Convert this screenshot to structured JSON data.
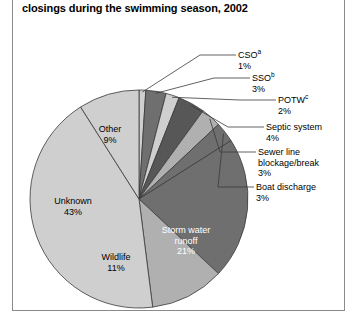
{
  "title": "closings during the swimming season, 2002",
  "colors": {
    "slice_light": "#cfcfcf",
    "slice_mid": "#b0b0b0",
    "slice_dark": "#6f6f6f",
    "slice_darker": "#575757",
    "outline": "#3a3a3a",
    "leader": "#3a3a3a",
    "border": "#8a8a8a",
    "text": "#000000",
    "text_light": "#ffffff"
  },
  "chart_data": {
    "type": "pie",
    "title": "closings during the swimming season, 2002",
    "xlabel": "",
    "ylabel": "",
    "legend_position": "none",
    "grid": false,
    "categories": [
      "CSO",
      "SSO",
      "POTW",
      "Septic system",
      "Sewer line blockage/break",
      "Boat discharge",
      "Storm water runoff",
      "Wildlife",
      "Unknown",
      "Other"
    ],
    "values": [
      1,
      3,
      2,
      4,
      3,
      3,
      21,
      11,
      43,
      9
    ],
    "value_labels": [
      "1%",
      "3%",
      "2%",
      "4%",
      "3%",
      "3%",
      "21%",
      "11%",
      "43%",
      "9%"
    ],
    "footnote_markers": [
      "a",
      "b",
      "c",
      "",
      "",
      "",
      "",
      "",
      "",
      ""
    ],
    "total": 100
  },
  "callouts": [
    {
      "name": "cso",
      "label": "CSO",
      "sup": "a",
      "value": "1%"
    },
    {
      "name": "sso",
      "label": "SSO",
      "sup": "b",
      "value": "3%"
    },
    {
      "name": "potw",
      "label": "POTW",
      "sup": "c",
      "value": "2%"
    },
    {
      "name": "septic",
      "label": "Septic system",
      "sup": "",
      "value": "4%"
    },
    {
      "name": "sewer",
      "label": "Sewer line",
      "label2": "blockage/break",
      "sup": "",
      "value": "3%"
    },
    {
      "name": "boat",
      "label": "Boat discharge",
      "sup": "",
      "value": "3%"
    }
  ],
  "inside_labels": [
    {
      "name": "other",
      "line1": "Other",
      "line2": "",
      "value": "9%"
    },
    {
      "name": "unknown",
      "line1": "Unknown",
      "line2": "",
      "value": "43%"
    },
    {
      "name": "wildlife",
      "line1": "Wildlife",
      "line2": "",
      "value": "11%"
    },
    {
      "name": "storm-water",
      "line1": "Storm water",
      "line2": "runoff",
      "value": "21%"
    }
  ]
}
